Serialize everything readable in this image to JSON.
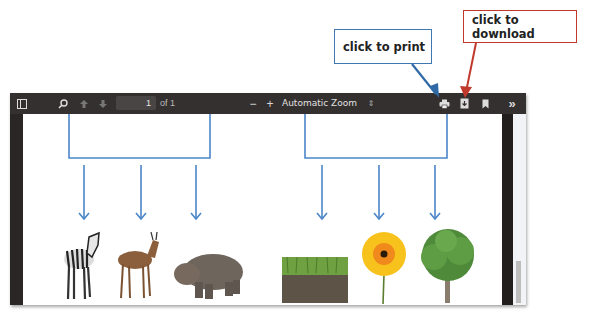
{
  "callouts": {
    "print": {
      "text": "click to print",
      "color": "#3f78b0"
    },
    "download": {
      "text": "click to download",
      "color": "#c0392b"
    }
  },
  "toolbar": {
    "sidebar_toggle": "sidebar-toggle",
    "search": "search",
    "prev_page": "previous-page",
    "next_page": "next-page",
    "page_number": "1",
    "page_count": "of 1",
    "zoom_out": "−",
    "zoom_in": "+",
    "zoom_level": "Automatic Zoom",
    "zoom_select_arrow": "⇕",
    "print": "print",
    "download": "download",
    "bookmark": "bookmark",
    "more": "»"
  },
  "diagram": {
    "animals": [
      "zebra",
      "gazelle",
      "hippopotamus"
    ],
    "plants": [
      "grass",
      "flower",
      "tree"
    ],
    "line_color": "#4a86c8"
  }
}
